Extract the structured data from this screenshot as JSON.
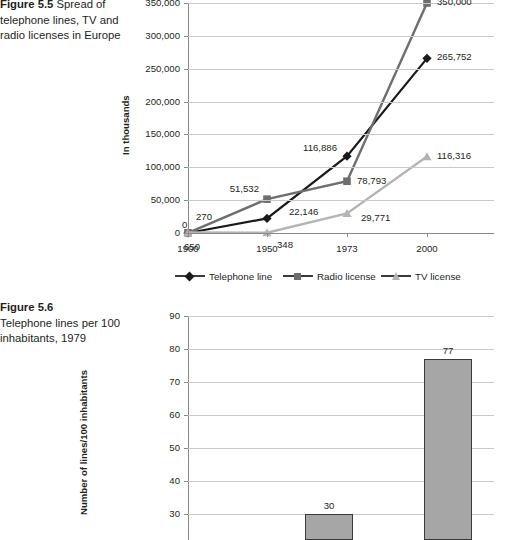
{
  "figure55": {
    "caption_number": "Figure 5.5",
    "caption_text": "Spread of telephone lines, TV and radio licenses in Europe"
  },
  "figure56": {
    "caption_number": "Figure 5.6",
    "caption_text": "Telephone lines per 100 inhabitants, 1979"
  },
  "colors": {
    "telephone_line": "#1a1a1a",
    "radio_license": "#6e6e6e",
    "tv_license": "#b4b4b4",
    "bar_fill": "#a6a6a6",
    "bar_stroke": "#3a3a3a",
    "gridline": "#c9c9c9",
    "axis": "#8a8a8a"
  },
  "chart_data": [
    {
      "type": "line",
      "title": "",
      "xlabel": "",
      "ylabel": "In thousands",
      "categories": [
        "1900",
        "1950",
        "1973",
        "2000"
      ],
      "x": [
        1900,
        1950,
        1973,
        2000
      ],
      "ylim": [
        0,
        350000
      ],
      "yticks": [
        0,
        50000,
        100000,
        150000,
        200000,
        250000,
        300000,
        350000
      ],
      "ytick_labels": [
        "0",
        "50,000",
        "100,000",
        "150,000",
        "200,000",
        "250,000",
        "300,000",
        "350,000"
      ],
      "grid": true,
      "legend_position": "bottom",
      "series": [
        {
          "name": "Telephone line",
          "marker": "diamond",
          "color": "#1a1a1a",
          "values": [
            0,
            22146,
            116886,
            265752
          ],
          "labels": [
            "0",
            "22,146",
            "116,886",
            "265,752"
          ]
        },
        {
          "name": "Radio license",
          "marker": "square",
          "color": "#6e6e6e",
          "values": [
            270,
            51532,
            78793,
            350000
          ],
          "labels": [
            "270",
            "51,532",
            "78,793",
            "350,000"
          ]
        },
        {
          "name": "TV license",
          "marker": "triangle",
          "color": "#b4b4b4",
          "values": [
            650,
            348,
            29771,
            116316
          ],
          "labels": [
            "650",
            "348",
            "29,771",
            "116,316"
          ]
        }
      ]
    },
    {
      "type": "bar",
      "title": "",
      "xlabel": "",
      "ylabel": "Number of lines/100 inhabitants",
      "categories": [
        "",
        ""
      ],
      "values": [
        30,
        77
      ],
      "value_labels": [
        "30",
        "77"
      ],
      "ylim": [
        0,
        90
      ],
      "yticks": [
        30,
        40,
        50,
        60,
        70,
        80,
        90
      ],
      "ytick_labels": [
        "30",
        "40",
        "50",
        "60",
        "70",
        "80",
        "90"
      ],
      "grid": true,
      "note": "bottom of chart is cropped by the screenshot edge"
    }
  ]
}
